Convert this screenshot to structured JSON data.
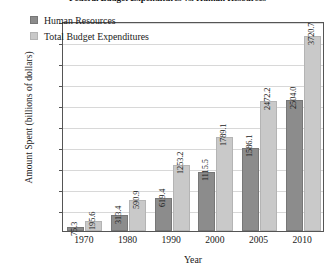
{
  "chart_data": {
    "type": "bar",
    "title": "Federal Budget Expenditures vs. Human Resources",
    "xlabel": "Year",
    "ylabel": "Amount Spent (billions of dollars)",
    "categories": [
      "1970",
      "1980",
      "1990",
      "2000",
      "2005",
      "2010"
    ],
    "series": [
      {
        "name": "Human Resources",
        "color": "#8c8c8c",
        "values": [
          75.3,
          313.4,
          619.4,
          1115.5,
          1586.1,
          2504.0
        ]
      },
      {
        "name": "Total Budget Expenditures",
        "color": "#c9c9c9",
        "values": [
          195.6,
          590.9,
          1253.2,
          1789.1,
          2472.2,
          3720.7
        ]
      }
    ],
    "ylim": [
      0,
      4000
    ],
    "ytick_labels": [
      "$4000",
      "$3600",
      "$3200",
      "$2800",
      "$2400",
      "$2000",
      "$1600",
      "$1200",
      "$800",
      "$400"
    ],
    "ytick_values": [
      4000,
      3600,
      3200,
      2800,
      2400,
      2000,
      1600,
      1200,
      800,
      400
    ],
    "grid": true,
    "legend_position": "top-left"
  }
}
